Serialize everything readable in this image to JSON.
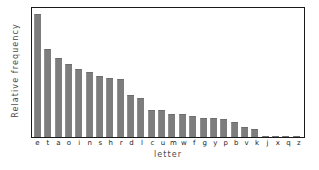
{
  "chart_data": {
    "type": "bar",
    "title": "",
    "xlabel": "letter",
    "ylabel": "Relative frequency",
    "categories": [
      "e",
      "t",
      "a",
      "o",
      "i",
      "n",
      "s",
      "h",
      "r",
      "d",
      "l",
      "c",
      "u",
      "m",
      "w",
      "f",
      "g",
      "y",
      "p",
      "b",
      "v",
      "k",
      "j",
      "x",
      "q",
      "z"
    ],
    "values": [
      12.7,
      9.1,
      8.2,
      7.5,
      7.0,
      6.7,
      6.3,
      6.1,
      6.0,
      4.3,
      4.0,
      2.8,
      2.8,
      2.4,
      2.4,
      2.2,
      2.0,
      2.0,
      1.9,
      1.5,
      1.0,
      0.8,
      0.15,
      0.15,
      0.1,
      0.07
    ],
    "ylim": [
      0,
      13.2
    ],
    "xlim_categories": 26,
    "grid": false,
    "legend": null,
    "bar_color": "#7d7d7d",
    "frame_color": "#1a1a1a",
    "background": "#ffffff"
  },
  "axis": {
    "y_title": "Relative frequency",
    "x_title": "letter"
  }
}
